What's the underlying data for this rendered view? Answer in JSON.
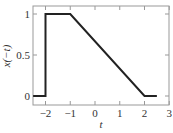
{
  "chart_data": {
    "type": "line",
    "title": "",
    "xlabel": "t",
    "ylabel": "x(−t)",
    "xlim": [
      -2.5,
      3
    ],
    "ylim": [
      -0.1,
      1.1
    ],
    "xticks": [
      -2,
      -1,
      0,
      1,
      2,
      3
    ],
    "yticks": [
      0,
      0.5,
      1
    ],
    "xtick_labels": [
      "−2",
      "−1",
      "0",
      "1",
      "2",
      "3"
    ],
    "ytick_labels": [
      "0",
      "0.5",
      "1"
    ],
    "grid": false,
    "legend": null,
    "series": [
      {
        "name": "x(-t)",
        "x": [
          -2.5,
          -2,
          -2,
          -1,
          2,
          2.5
        ],
        "y": [
          0,
          0,
          1,
          1,
          0,
          0
        ]
      }
    ],
    "line_color": "#222222"
  }
}
